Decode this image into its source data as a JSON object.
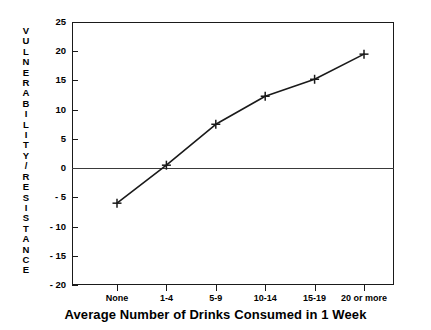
{
  "chart_data": {
    "type": "line",
    "title": "",
    "xlabel": "Average Number of Drinks Consumed in 1 Week",
    "ylabel": "VULNERABILITY/RESISTANCE",
    "categories": [
      "None",
      "1-4",
      "5-9",
      "10-14",
      "15-19",
      "20 or more"
    ],
    "values": [
      -6,
      0.5,
      7.5,
      12.3,
      15.2,
      19.5
    ],
    "series": [
      {
        "name": "Vulnerability/Resistance",
        "values": [
          -6,
          0.5,
          7.5,
          12.3,
          15.2,
          19.5
        ]
      }
    ],
    "ylim": [
      -20,
      25
    ],
    "yticks": [
      25,
      20,
      15,
      10,
      5,
      0,
      -5,
      -10,
      -15,
      -20
    ],
    "ytick_labels": [
      "25",
      "20",
      "15",
      "10",
      "5",
      "0",
      "- 5",
      "- 10",
      "- 15",
      "- 20"
    ],
    "grid": false,
    "legend": false,
    "legend_position": "none",
    "marker": "plus",
    "line_color": "#1a1a1a",
    "zero_line": 0,
    "annotations": []
  },
  "axis": {
    "ylabel_chars": [
      "V",
      "U",
      "L",
      "N",
      "E",
      "R",
      "A",
      "B",
      "I",
      "L",
      "I",
      "T",
      "Y",
      "/",
      "R",
      "E",
      "S",
      "I",
      "S",
      "T",
      "A",
      "N",
      "C",
      "E"
    ]
  }
}
